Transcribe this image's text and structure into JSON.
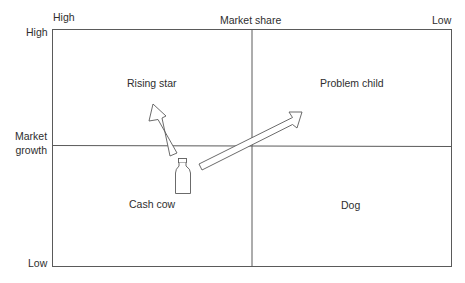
{
  "axes": {
    "x_high": "High",
    "x_title": "Market share",
    "x_low": "Low",
    "y_high": "High",
    "y_title_line1": "Market",
    "y_title_line2": "growth",
    "y_low": "Low"
  },
  "quadrants": {
    "top_left": "Rising star",
    "top_right": "Problem child",
    "bottom_left": "Cash cow",
    "bottom_right": "Dog"
  },
  "icons": {
    "bottle": "milk-bottle-icon",
    "arrow_to_star": "arrow-up-left-icon",
    "arrow_to_problem": "arrow-up-right-icon"
  },
  "colors": {
    "line": "#5a5a5a",
    "text": "#2e2e2e",
    "background": "#ffffff"
  }
}
